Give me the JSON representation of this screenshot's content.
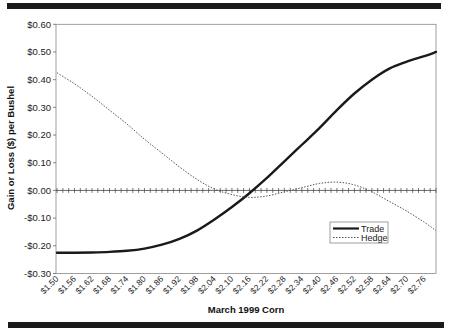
{
  "chart_data": {
    "type": "line",
    "title": "",
    "xlabel": "March 1999 Corn",
    "ylabel": "Gain or Loss ($) per Bushel",
    "ylim": [
      -0.3,
      0.6
    ],
    "y_ticks": [
      "$0.60",
      "$0.50",
      "$0.40",
      "$0.30",
      "$0.20",
      "$0.10",
      "$0.00",
      "-$0.10",
      "-$0.20",
      "-$0.30"
    ],
    "y_tick_values": [
      0.6,
      0.5,
      0.4,
      0.3,
      0.2,
      0.1,
      0.0,
      -0.1,
      -0.2,
      -0.3
    ],
    "x_tick_labels": [
      "$1.50",
      "$1.56",
      "$1.62",
      "$1.68",
      "$1.74",
      "$1.80",
      "$1.86",
      "$1.92",
      "$1.98",
      "$2.04",
      "$2.10",
      "$2.16",
      "$2.22",
      "$2.28",
      "$2.34",
      "$2.40",
      "$2.46",
      "$2.52",
      "$2.58",
      "$2.64",
      "$2.70",
      "$2.76"
    ],
    "x": [
      1.5,
      1.56,
      1.62,
      1.68,
      1.74,
      1.8,
      1.86,
      1.92,
      1.98,
      2.04,
      2.1,
      2.16,
      2.22,
      2.28,
      2.34,
      2.4,
      2.46,
      2.52,
      2.58,
      2.64,
      2.7,
      2.76,
      2.8
    ],
    "xlim": [
      1.5,
      2.8
    ],
    "grid": false,
    "legend_position": "lower right inside",
    "series": [
      {
        "name": "Trade",
        "style": "solid",
        "color": "#1a1a1a",
        "values": [
          -0.225,
          -0.225,
          -0.224,
          -0.222,
          -0.218,
          -0.21,
          -0.196,
          -0.175,
          -0.145,
          -0.105,
          -0.06,
          -0.01,
          0.045,
          0.105,
          0.165,
          0.225,
          0.29,
          0.35,
          0.4,
          0.44,
          0.465,
          0.485,
          0.5
        ]
      },
      {
        "name": "Hedge",
        "style": "dotted",
        "color": "#555555",
        "values": [
          0.425,
          0.385,
          0.34,
          0.29,
          0.24,
          0.185,
          0.135,
          0.085,
          0.04,
          0.005,
          -0.015,
          -0.025,
          -0.02,
          -0.005,
          0.01,
          0.025,
          0.03,
          0.02,
          -0.005,
          -0.04,
          -0.075,
          -0.115,
          -0.145
        ]
      }
    ],
    "zero_line": {
      "value": 0.0,
      "tick_step": 0.02
    }
  }
}
